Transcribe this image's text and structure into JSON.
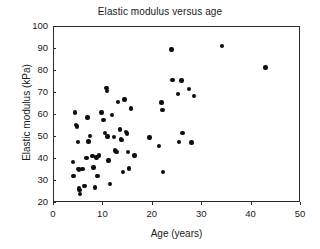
{
  "chart_data": {
    "type": "scatter",
    "title": "Elastic modulus versus age",
    "xlabel": "Age (years)",
    "ylabel": "Elastic modulus (kPa)",
    "xlim": [
      0,
      50
    ],
    "ylim": [
      20,
      100
    ],
    "xticks": [
      0,
      10,
      20,
      30,
      40,
      50
    ],
    "yticks": [
      20,
      30,
      40,
      50,
      60,
      70,
      80,
      90,
      100
    ],
    "xtick_labels": [
      "0",
      "10",
      "20",
      "30",
      "40",
      "50"
    ],
    "ytick_labels": [
      "20",
      "30",
      "40",
      "50",
      "60",
      "70",
      "80",
      "90",
      "100"
    ],
    "grid": false,
    "legend": null,
    "marker": "filled-circle",
    "marker_color": "#0d0d0d",
    "series": [
      {
        "name": "Elastic modulus",
        "points": [
          [
            4.0,
            38.3
          ],
          [
            4.1,
            31.8
          ],
          [
            4.3,
            31.9
          ],
          [
            4.5,
            60.7
          ],
          [
            4.7,
            55.0
          ],
          [
            4.8,
            54.3
          ],
          [
            5.0,
            47.2
          ],
          [
            5.1,
            35.0
          ],
          [
            5.2,
            34.8
          ],
          [
            5.3,
            26.3
          ],
          [
            5.4,
            25.5
          ],
          [
            5.5,
            23.6
          ],
          [
            6.0,
            35.0
          ],
          [
            6.3,
            27.2
          ],
          [
            6.5,
            27.3
          ],
          [
            6.8,
            40.0
          ],
          [
            7.0,
            58.5
          ],
          [
            7.2,
            47.5
          ],
          [
            7.5,
            50.0
          ],
          [
            8.0,
            41.0
          ],
          [
            8.2,
            35.6
          ],
          [
            8.5,
            26.6
          ],
          [
            8.8,
            40.2
          ],
          [
            9.0,
            31.9
          ],
          [
            9.3,
            41.2
          ],
          [
            9.8,
            60.7
          ],
          [
            10.2,
            57.2
          ],
          [
            10.5,
            51.5
          ],
          [
            10.8,
            71.8
          ],
          [
            10.9,
            70.5
          ],
          [
            11.0,
            49.8
          ],
          [
            11.2,
            38.9
          ],
          [
            11.5,
            28.3
          ],
          [
            12.0,
            59.6
          ],
          [
            12.3,
            49.5
          ],
          [
            12.6,
            43.4
          ],
          [
            12.8,
            43.0
          ],
          [
            13.0,
            42.6
          ],
          [
            13.2,
            65.5
          ],
          [
            13.5,
            53.0
          ],
          [
            13.8,
            48.5
          ],
          [
            14.0,
            48.3
          ],
          [
            14.2,
            33.6
          ],
          [
            14.5,
            66.6
          ],
          [
            14.8,
            51.8
          ],
          [
            15.0,
            51.2
          ],
          [
            15.2,
            42.8
          ],
          [
            15.4,
            35.3
          ],
          [
            15.8,
            62.5
          ],
          [
            16.5,
            41.2
          ],
          [
            19.5,
            49.3
          ],
          [
            21.5,
            45.5
          ],
          [
            22.0,
            65.3
          ],
          [
            22.2,
            61.8
          ],
          [
            22.3,
            33.7
          ],
          [
            24.0,
            89.4
          ],
          [
            24.2,
            75.5
          ],
          [
            25.3,
            69.2
          ],
          [
            25.5,
            47.3
          ],
          [
            26.0,
            75.3
          ],
          [
            26.2,
            51.5
          ],
          [
            27.5,
            71.3
          ],
          [
            28.0,
            47.1
          ],
          [
            28.6,
            68.2
          ],
          [
            34.2,
            90.8
          ],
          [
            43.0,
            81.2
          ]
        ]
      }
    ]
  }
}
